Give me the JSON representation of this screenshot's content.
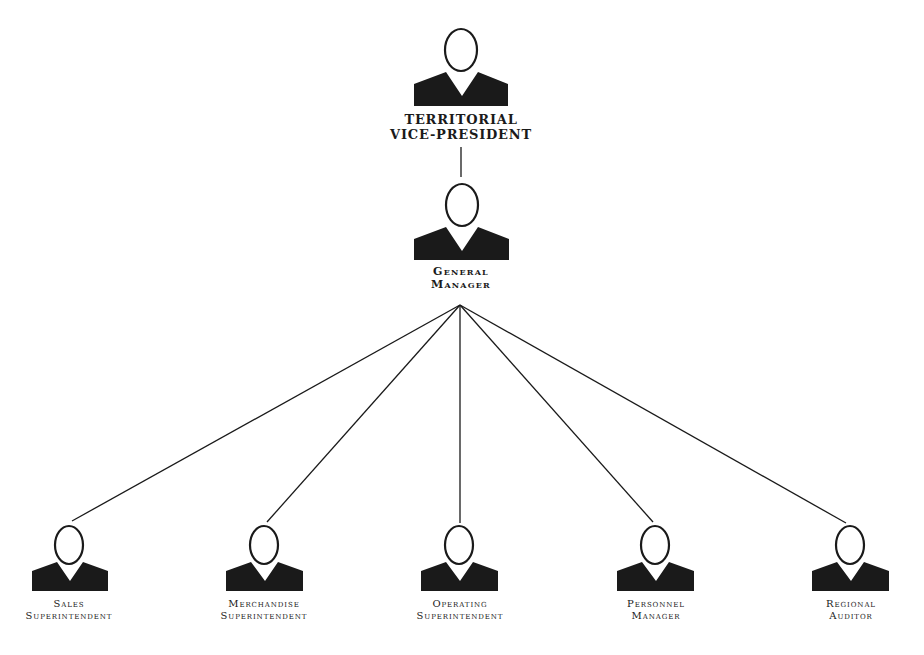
{
  "diagram": {
    "type": "org-chart",
    "nodes": [
      {
        "id": "territorial-vp",
        "line1": "TERRITORIAL",
        "line2": "VICE-PRESIDENT",
        "level": 0,
        "x": 461
      },
      {
        "id": "general-manager",
        "line1": "General",
        "line2": "Manager",
        "level": 1,
        "x": 461
      },
      {
        "id": "sales-superintendent",
        "line1": "Sales",
        "line2": "Superintendent",
        "level": 2,
        "x": 69
      },
      {
        "id": "merchandise-superintendent",
        "line1": "Merchandise",
        "line2": "Superintendent",
        "level": 2,
        "x": 264
      },
      {
        "id": "operating-superintendent",
        "line1": "Operating",
        "line2": "Superintendent",
        "level": 2,
        "x": 459
      },
      {
        "id": "personnel-manager",
        "line1": "Personnel",
        "line2": "Manager",
        "level": 2,
        "x": 655
      },
      {
        "id": "regional-auditor",
        "line1": "Regional",
        "line2": "Auditor",
        "level": 2,
        "x": 850
      }
    ],
    "edges": [
      {
        "from": "territorial-vp",
        "to": "general-manager"
      },
      {
        "from": "general-manager",
        "to": "sales-superintendent"
      },
      {
        "from": "general-manager",
        "to": "merchandise-superintendent"
      },
      {
        "from": "general-manager",
        "to": "operating-superintendent"
      },
      {
        "from": "general-manager",
        "to": "personnel-manager"
      },
      {
        "from": "general-manager",
        "to": "regional-auditor"
      }
    ],
    "colors": {
      "ink": "#1a1a1a",
      "background": "#ffffff"
    }
  }
}
